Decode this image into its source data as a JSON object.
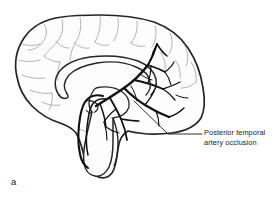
{
  "figure": {
    "panel_letter": "a",
    "background_color": "#ffffff",
    "annotation": {
      "label": "Posterior temporal\nartery occlusion",
      "line1": "Posterior temporal",
      "line2": "artery occlusion",
      "text_color": "#1a1a1a"
    },
    "colors": {
      "outline": "#262626",
      "sulci": "#9a9a9a",
      "artery": "#111111",
      "infarct_fill": "#b2b2b2",
      "infarct_stroke": "#8c8c8c",
      "leader_line": "#1a1a1a",
      "brain_fill": "#fdfdfd"
    },
    "structures": [
      {
        "name": "cerebral-hemisphere-outline",
        "description": "medial sagittal cerebral cortex outline"
      },
      {
        "name": "corpus-callosum",
        "description": "arched midline commissure"
      },
      {
        "name": "thalamus-midbrain",
        "description": "central diencephalic mass"
      },
      {
        "name": "brainstem",
        "description": "pons and medulla descending inferiorly"
      },
      {
        "name": "cerebellum-region",
        "description": "posterior inferior region"
      },
      {
        "name": "posterior-cerebral-artery-tree",
        "description": "branching black arterial tree over occipital and temporal cortex"
      },
      {
        "name": "basilar-artery",
        "description": "dark vessel curving along anterior brainstem"
      },
      {
        "name": "infarct-zone",
        "description": "gray shaded posterior temporal infarct territory"
      }
    ]
  }
}
